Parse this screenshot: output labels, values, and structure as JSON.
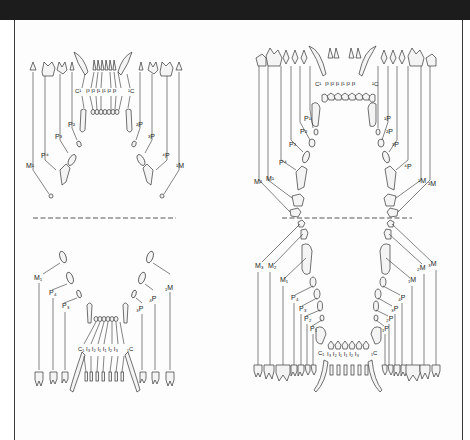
{
  "figure": {
    "type": "dental-formula-diagram",
    "panels": [
      {
        "id": "cat",
        "upper": {
          "labels_left": [
            "M¹",
            "P⁴",
            "P³",
            "P²",
            "C¹",
            "I³",
            "I²",
            "I¹"
          ],
          "labels_right": [
            "¹I",
            "²I",
            "³I",
            "¹C",
            "²P",
            "³P",
            "⁴P",
            "¹M"
          ],
          "center_row": "C¹ I³ I² I¹ I¹ I² I³ C¹"
        },
        "lower": {
          "labels_left": [
            "M₁",
            "P₄",
            "P₃",
            "C₁",
            "I₃",
            "I₂",
            "I₁"
          ],
          "labels_right": [
            "₁I",
            "₂I",
            "₃I",
            "₁C",
            "₃P",
            "₄P",
            "₁M"
          ],
          "center_row": "C₁ I₃ I₂ I₁ I₁ I₂ I₃ C₁"
        }
      },
      {
        "id": "dog",
        "upper": {
          "labels_left": [
            "M²",
            "M¹",
            "P⁴",
            "P³",
            "P²",
            "P¹",
            "C¹",
            "I³",
            "I²",
            "I¹"
          ],
          "labels_right": [
            "¹I",
            "²I",
            "³I",
            "¹C",
            "¹P",
            "²P",
            "³P",
            "⁴P",
            "¹M",
            "²M"
          ],
          "center_row": "C¹ I³ I² I¹ I¹ I² I³ C¹"
        },
        "lower": {
          "labels_left": [
            "M₃",
            "M₂",
            "M₁",
            "P₄",
            "P₃",
            "P₂",
            "P₁",
            "C₁",
            "I₃",
            "I₂",
            "I₁"
          ],
          "labels_right": [
            "₁I",
            "₂I",
            "₃I",
            "₁C",
            "₁P",
            "₂P",
            "₃P",
            "₄P",
            "₁M",
            "₂M",
            "₃M"
          ],
          "center_row": "C₁ I₃ I₂ I₁ I₁ I₂ I₃ C₁"
        }
      }
    ],
    "separator": "dashed-line",
    "colors": {
      "header_band": "#1c1c1c",
      "line": "#333333",
      "background": "#ffffff"
    }
  },
  "labels": {
    "cat_upper": {
      "C_left": "C¹",
      "C_right": "¹C",
      "I_row": "I³ I² I¹ I¹ I² I³",
      "P2_left": "P²",
      "P3_left": "P³",
      "P4_left": "P⁴",
      "M1_left": "M¹",
      "P2_right": "²P",
      "P3_right": "³P",
      "P4_right": "⁴P",
      "M1_right": "¹M"
    },
    "cat_lower": {
      "C_left": "C₁",
      "C_right": "₁C",
      "I_row": "I₃ I₂ I₁ I₁ I₂ I₃",
      "M1_left": "M₁",
      "P4_left": "P₄",
      "P3_left": "P₃",
      "M1_right": "₁M",
      "P4_right": "₄P",
      "P3_right": "₃P"
    },
    "dog_upper": {
      "C_left": "C¹",
      "C_right": "¹C",
      "I_row": "I³ I² I¹ I¹ I² I³",
      "P1_left": "P¹",
      "P2_left": "P²",
      "P3_left": "P³",
      "P4_left": "P⁴",
      "M1_left": "M¹",
      "M2_left": "M²",
      "P1_right": "¹P",
      "P2_right": "²P",
      "P3_right": "³P",
      "P4_right": "⁴P",
      "M1_right": "¹M",
      "M2_right": "²M"
    },
    "dog_lower": {
      "C_left": "C₁",
      "C_right": "₁C",
      "I_row": "I₃ I₂ I₁ I₁ I₂ I₃",
      "M3_left": "M₃",
      "M2_left": "M₂",
      "M1_left": "M₁",
      "P4_left": "P₄",
      "P3_left": "P₃",
      "P2_left": "P₂",
      "P1_left": "P₁",
      "M3_right": "₃M",
      "M2_right": "₂M",
      "M1_right": "₁M",
      "P4_right": "₄P",
      "P3_right": "₃P",
      "P2_right": "₂P",
      "P1_right": "₁P"
    }
  }
}
